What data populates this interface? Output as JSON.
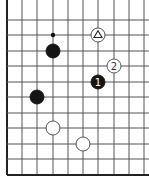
{
  "board": {
    "xs": [
      7,
      22,
      37,
      53,
      68,
      83,
      98,
      114,
      129,
      144
    ],
    "ys": [
      20,
      35,
      51,
      66,
      82,
      97,
      113,
      128,
      144,
      159,
      175
    ],
    "edge_left": true,
    "edge_bottom": true,
    "line_color": "#555555",
    "edge_color": "#222222"
  },
  "markers": [
    {
      "type": "dot",
      "col": 3,
      "row": 1
    }
  ],
  "stones": [
    {
      "color": "black",
      "col": 3,
      "row": 2,
      "label": ""
    },
    {
      "color": "white",
      "col": 6,
      "row": 1,
      "label": "triangle"
    },
    {
      "color": "white",
      "col": 7,
      "row": 3,
      "label": "2"
    },
    {
      "color": "black",
      "col": 6,
      "row": 4,
      "label": "1"
    },
    {
      "color": "black",
      "col": 2,
      "row": 5,
      "label": ""
    },
    {
      "color": "white",
      "col": 3,
      "row": 7,
      "label": ""
    },
    {
      "color": "white",
      "col": 5,
      "row": 8,
      "label": ""
    }
  ]
}
